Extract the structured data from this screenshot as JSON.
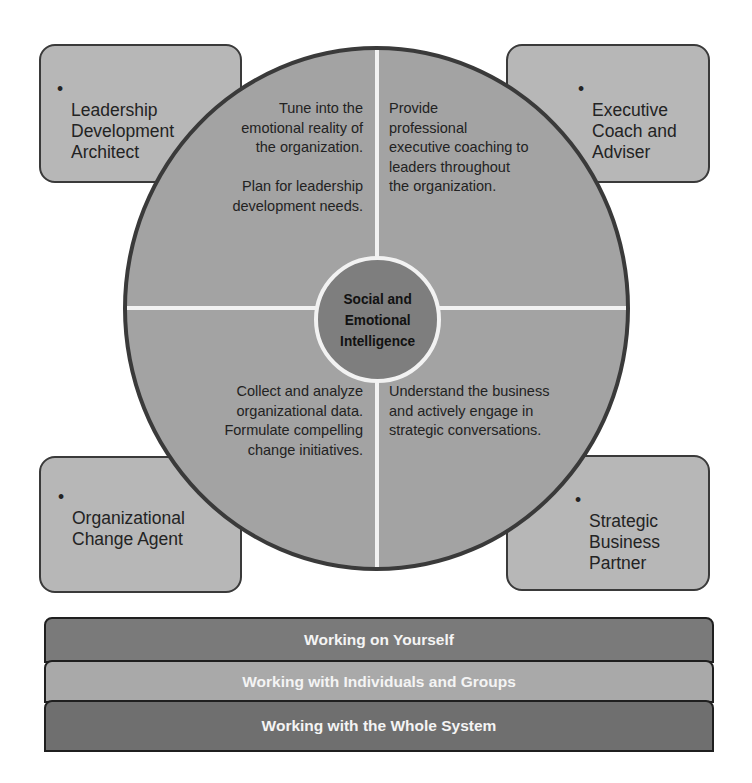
{
  "roles": [
    {
      "id": "top-left",
      "label": "Leadership\nDevelopment\nArchitect"
    },
    {
      "id": "top-right",
      "label": "Executive\nCoach and\nAdviser"
    },
    {
      "id": "bottom-left",
      "label": "Organizational\nChange Agent"
    },
    {
      "id": "bottom-right",
      "label": "Strategic\nBusiness\nPartner"
    }
  ],
  "bullet": "•",
  "quadrants": {
    "top_left": "Tune into the\nemotional reality of\nthe organization.\n\nPlan for leadership\ndevelopment needs.",
    "top_right": "Provide\nprofessional\nexecutive coaching to\nleaders throughout\nthe organization.",
    "bottom_left": "Collect and analyze\norganizational data.\nFormulate compelling\nchange initiatives.",
    "bottom_right": "Understand the business\nand actively engage in\nstrategic conversations."
  },
  "hub": {
    "label": "Social and\nEmotional\nIntelligence"
  },
  "layers": [
    {
      "label": "Working on Yourself",
      "color": "#7a7a7a"
    },
    {
      "label": "Working with Individuals and Groups",
      "color": "#a9a9a9"
    },
    {
      "label": "Working with the Whole System",
      "color": "#6f6f6f"
    }
  ],
  "colors": {
    "role_box": "#b7b7b7",
    "wheel": "#a3a3a3",
    "hub": "#7e7e7e",
    "outline": "#3a3a3a",
    "divider": "#f2f2f2"
  }
}
